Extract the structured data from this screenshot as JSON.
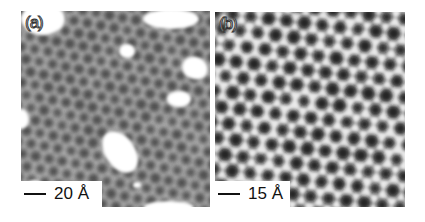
{
  "figure": {
    "panels": [
      {
        "id": "a",
        "label": "(a)",
        "scale_bar": "20 Å",
        "description": "STM image: hexagonal lattice with bright adsorbate blobs",
        "colors": {
          "background": "#8a8a8a",
          "dark": "#3a3a3a",
          "bright": "#ffffff"
        }
      },
      {
        "id": "b",
        "label": "(b)",
        "scale_bar": "15 Å",
        "description": "STM image: high-contrast hexagonal lattice with dark holes",
        "colors": {
          "background": "#9a9a9a",
          "dark": "#151515",
          "bright": "#f4f4f4"
        }
      }
    ]
  }
}
